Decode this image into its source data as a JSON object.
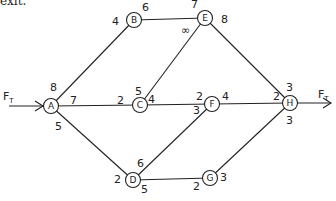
{
  "header_fragment": "exit.",
  "flow_label": "F",
  "flow_sub": "T",
  "nodes": {
    "A": {
      "label": "A",
      "x": 51,
      "y": 106
    },
    "B": {
      "label": "B",
      "x": 134,
      "y": 20
    },
    "C": {
      "label": "C",
      "x": 140,
      "y": 105
    },
    "D": {
      "label": "D",
      "x": 133,
      "y": 180
    },
    "E": {
      "label": "E",
      "x": 205,
      "y": 18
    },
    "F": {
      "label": "F",
      "x": 212,
      "y": 104
    },
    "G": {
      "label": "G",
      "x": 210,
      "y": 178
    },
    "H": {
      "label": "H",
      "x": 290,
      "y": 103
    }
  },
  "edges": [
    {
      "from": "A",
      "to": "B",
      "cap_from": "8",
      "cap_to": "4"
    },
    {
      "from": "A",
      "to": "C",
      "cap_from": "7",
      "cap_to": "2"
    },
    {
      "from": "A",
      "to": "D",
      "cap_from": "5",
      "cap_to": "2"
    },
    {
      "from": "B",
      "to": "E",
      "cap_from": "6",
      "cap_to": "7"
    },
    {
      "from": "C",
      "to": "E",
      "cap_from": "5",
      "cap_to": "∞"
    },
    {
      "from": "C",
      "to": "F",
      "cap_from": "4",
      "cap_to": "2"
    },
    {
      "from": "D",
      "to": "F",
      "cap_from": "6",
      "cap_to": "3"
    },
    {
      "from": "D",
      "to": "G",
      "cap_from": "5",
      "cap_to": "2"
    },
    {
      "from": "E",
      "to": "H",
      "cap_from": "8",
      "cap_to": "3"
    },
    {
      "from": "F",
      "to": "H",
      "cap_from": "4",
      "cap_to": "2"
    },
    {
      "from": "G",
      "to": "H",
      "cap_from": "3",
      "cap_to": "3"
    }
  ],
  "labels": {
    "A_B_8": "8",
    "A_C_7": "7",
    "A_D_5": "5",
    "B_4": "4",
    "B_6": "6",
    "E_7": "7",
    "E_inf": "∞",
    "E_8": "8",
    "C_5": "5",
    "C_2": "2",
    "C_4": "4",
    "F_2": "2",
    "F_3": "3",
    "F_4": "4",
    "D_2": "2",
    "D_6": "6",
    "D_5": "5",
    "G_2": "2",
    "G_3": "3",
    "H_2": "2",
    "H_3top": "3",
    "H_3bot": "3"
  }
}
